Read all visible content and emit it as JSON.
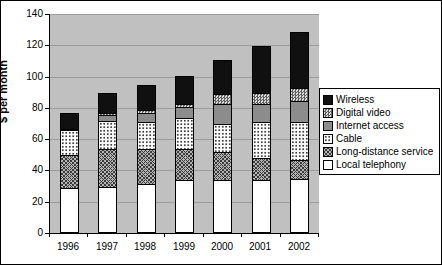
{
  "figure": {
    "background": "#ffffff",
    "plot_background": "#c0c0c0",
    "gridline_color": "#9b9b9b",
    "bar_border_color": "#000000"
  },
  "chart_data": {
    "type": "bar",
    "stacked": true,
    "title": "",
    "xlabel": "",
    "ylabel": "$ per month",
    "ylim": [
      0,
      140
    ],
    "y_tick_step": 20,
    "y_ticks": [
      0,
      20,
      40,
      60,
      80,
      100,
      120,
      140
    ],
    "grid": true,
    "legend_position": "right",
    "categories": [
      "1996",
      "1997",
      "1998",
      "1999",
      "2000",
      "2001",
      "2002"
    ],
    "series": [
      {
        "name": "Local telephony",
        "key": "local",
        "values": [
          28,
          29,
          31,
          33,
          33,
          33,
          34
        ]
      },
      {
        "name": "Long-distance service",
        "key": "ld",
        "values": [
          21,
          24,
          22,
          20,
          18,
          14,
          12
        ]
      },
      {
        "name": "Cable",
        "key": "cable",
        "values": [
          16,
          18,
          17,
          20,
          18,
          23,
          24
        ]
      },
      {
        "name": "Internet access",
        "key": "internet",
        "values": [
          1,
          4,
          6,
          7,
          13,
          12,
          14
        ]
      },
      {
        "name": "Digital video",
        "key": "dv",
        "values": [
          0,
          1,
          2,
          2,
          6,
          7,
          8
        ]
      },
      {
        "name": "Wireless",
        "key": "wireless",
        "values": [
          10,
          13,
          16,
          18,
          22,
          30,
          36
        ]
      }
    ],
    "totals": [
      76,
      89,
      94,
      100,
      110,
      119,
      128
    ]
  },
  "legend": {
    "items": [
      {
        "label": "Wireless",
        "key": "wireless"
      },
      {
        "label": "Digital video",
        "key": "dv"
      },
      {
        "label": "Internet access",
        "key": "internet"
      },
      {
        "label": "Cable",
        "key": "cable"
      },
      {
        "label": "Long-distance service",
        "key": "ld"
      },
      {
        "label": "Local telephony",
        "key": "local"
      }
    ]
  }
}
